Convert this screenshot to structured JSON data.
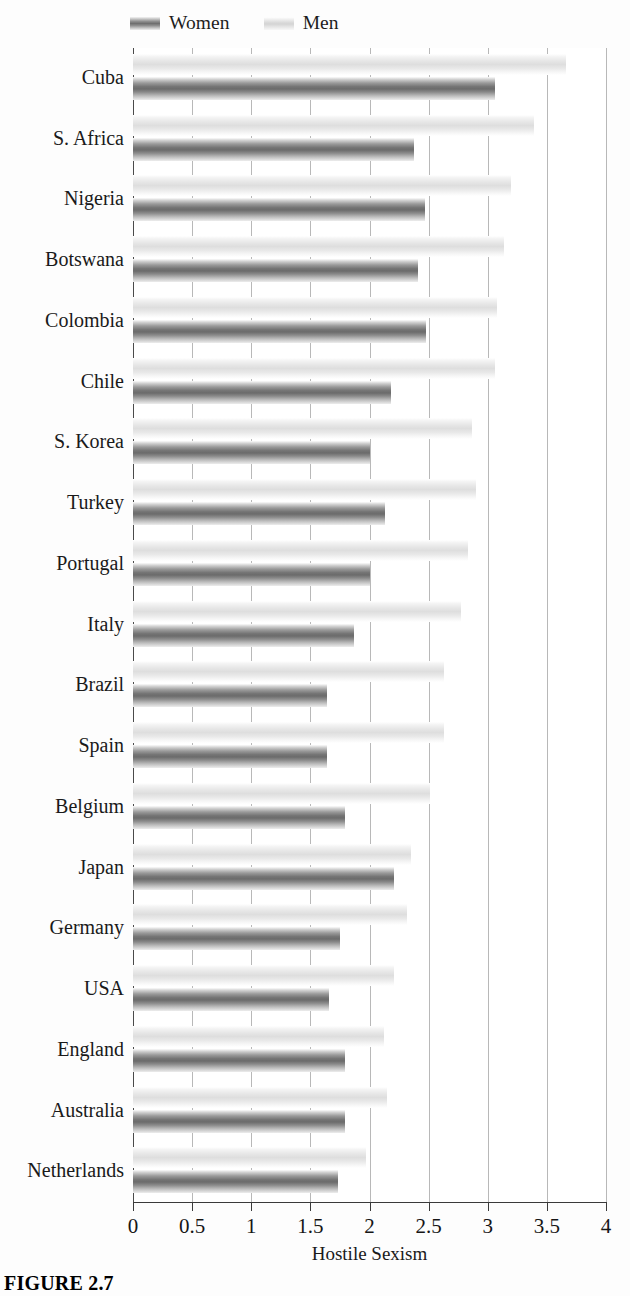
{
  "legend": {
    "entries": [
      {
        "key": "women",
        "label": "Women",
        "swatch": "women-swatch",
        "color": "#6f6f6f"
      },
      {
        "key": "men",
        "label": "Men",
        "swatch": "men-swatch",
        "color": "#dedede"
      }
    ]
  },
  "axis": {
    "title": "Hostile Sexism",
    "ticks": [
      "0",
      "0.5",
      "1",
      "1.5",
      "2",
      "2.5",
      "3",
      "3.5",
      "4"
    ],
    "min": 0,
    "max": 4,
    "step": 0.5
  },
  "caption": {
    "text": "FIGURE 2.7"
  },
  "chart_data": {
    "type": "bar",
    "orientation": "horizontal",
    "title": "FIGURE 2.7",
    "xlabel": "Hostile Sexism",
    "ylabel": "",
    "xlim": [
      0,
      4
    ],
    "xticks": [
      0,
      0.5,
      1,
      1.5,
      2,
      2.5,
      3,
      3.5,
      4
    ],
    "grid": true,
    "legend_position": "top-left",
    "categories": [
      "Cuba",
      "S. Africa",
      "Nigeria",
      "Botswana",
      "Colombia",
      "Chile",
      "S. Korea",
      "Turkey",
      "Portugal",
      "Italy",
      "Brazil",
      "Spain",
      "Belgium",
      "Japan",
      "Germany",
      "USA",
      "England",
      "Australia",
      "Netherlands"
    ],
    "series": [
      {
        "name": "Women",
        "color": "#6f6f6f",
        "values": [
          3.06,
          2.38,
          2.47,
          2.41,
          2.48,
          2.18,
          2.0,
          2.13,
          2.0,
          1.87,
          1.64,
          1.64,
          1.79,
          2.21,
          1.75,
          1.66,
          1.79,
          1.79,
          1.73
        ]
      },
      {
        "name": "Men",
        "color": "#dedede",
        "values": [
          3.66,
          3.39,
          3.2,
          3.14,
          3.08,
          3.06,
          2.87,
          2.9,
          2.83,
          2.77,
          2.63,
          2.63,
          2.51,
          2.35,
          2.32,
          2.21,
          2.12,
          2.15,
          1.97
        ]
      }
    ]
  }
}
